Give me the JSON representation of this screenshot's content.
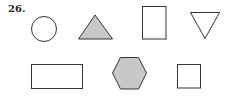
{
  "problem_number": "26.",
  "colors": {
    "stroke": "#333333",
    "shaded_fill": "#c8c8c8",
    "unshaded_fill": "#ffffff"
  },
  "shapes": [
    {
      "type": "circle",
      "shaded": false
    },
    {
      "type": "triangle",
      "shaded": true
    },
    {
      "type": "rectangle-tall",
      "shaded": false
    },
    {
      "type": "triangle-inverted",
      "shaded": false
    },
    {
      "type": "rectangle-wide",
      "shaded": false
    },
    {
      "type": "hexagon",
      "shaded": true
    },
    {
      "type": "square",
      "shaded": false
    }
  ]
}
